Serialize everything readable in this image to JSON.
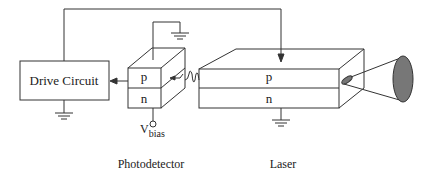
{
  "diagram": {
    "drive_circuit": {
      "label": "Drive Circuit"
    },
    "photodetector": {
      "p_label": "p",
      "n_label": "n",
      "bias_label_main": "V",
      "bias_label_sub": "bias",
      "caption": "Photodetector"
    },
    "laser": {
      "p_label": "p",
      "n_label": "n",
      "caption": "Laser"
    },
    "colors": {
      "line": "#333333",
      "beam_fill": "#777777",
      "background": "#ffffff"
    }
  }
}
